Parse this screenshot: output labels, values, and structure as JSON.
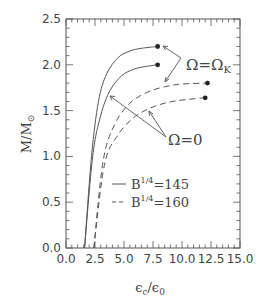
{
  "chart_data": {
    "type": "line",
    "title": "",
    "xlabel": "ε_c/ε_0",
    "ylabel": "M/M_⊙",
    "xlim": [
      0.0,
      15.0
    ],
    "ylim": [
      0.0,
      2.5
    ],
    "xticks": [
      "0.0",
      "2.5",
      "5.0",
      "7.5",
      "10.0",
      "12.5",
      "15.0"
    ],
    "yticks": [
      "0.0",
      "0.5",
      "1.0",
      "1.5",
      "2.0",
      "2.5"
    ],
    "grid": false,
    "legend": {
      "position": "lower right inside",
      "entries": [
        {
          "label_base": "B",
          "label_sup": "1/4",
          "label_value": "=145",
          "style": "solid"
        },
        {
          "label_base": "B",
          "label_sup": "1/4",
          "label_value": "=160",
          "style": "dashed"
        }
      ]
    },
    "annotations": [
      {
        "text": "Ω=Ω",
        "subscript": "K",
        "points_to": [
          "solid Ω=Ω_K endpoint",
          "dashed Ω=Ω_K curve"
        ]
      },
      {
        "text": "Ω=0",
        "points_to": [
          "solid Ω=0 curve",
          "dashed Ω=0 curve"
        ]
      }
    ],
    "series": [
      {
        "name": "B^1/4=145, Ω=Ω_K",
        "style": "solid",
        "x": [
          1.6,
          2.2,
          2.8,
          3.5,
          4.5,
          5.5,
          6.5,
          7.9
        ],
        "y": [
          0.0,
          1.0,
          1.6,
          1.9,
          2.08,
          2.15,
          2.18,
          2.2
        ],
        "endpoint_marker": true
      },
      {
        "name": "B^1/4=145, Ω=0",
        "style": "solid",
        "x": [
          1.6,
          2.3,
          3.0,
          3.8,
          4.8,
          5.8,
          6.8,
          7.9
        ],
        "y": [
          0.0,
          1.0,
          1.45,
          1.72,
          1.88,
          1.95,
          1.98,
          2.0
        ],
        "endpoint_marker": true
      },
      {
        "name": "B^1/4=160, Ω=Ω_K",
        "style": "dashed",
        "x": [
          2.4,
          3.2,
          4.2,
          5.5,
          7.0,
          8.5,
          10.0,
          12.2
        ],
        "y": [
          0.0,
          0.95,
          1.35,
          1.58,
          1.7,
          1.76,
          1.79,
          1.8
        ],
        "endpoint_marker": true
      },
      {
        "name": "B^1/4=160, Ω=0",
        "style": "dashed",
        "x": [
          2.4,
          3.3,
          4.4,
          5.8,
          7.3,
          8.8,
          10.3,
          12.0
        ],
        "y": [
          0.0,
          0.9,
          1.22,
          1.42,
          1.53,
          1.59,
          1.62,
          1.64
        ],
        "endpoint_marker": true
      }
    ]
  }
}
